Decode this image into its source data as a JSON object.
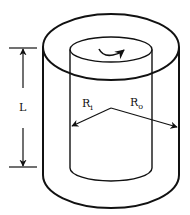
{
  "diagram": {
    "labels": {
      "length": "L",
      "inner_radius": "R",
      "inner_radius_sub": "i",
      "outer_radius": "R",
      "outer_radius_sub": "o"
    },
    "colors": {
      "stroke": "#111111",
      "background": "#ffffff"
    },
    "components": [
      "outer-cylinder",
      "inner-cylinder",
      "rotation-arrow",
      "length-dimension",
      "inner-radius-arrow",
      "outer-radius-arrow"
    ]
  }
}
